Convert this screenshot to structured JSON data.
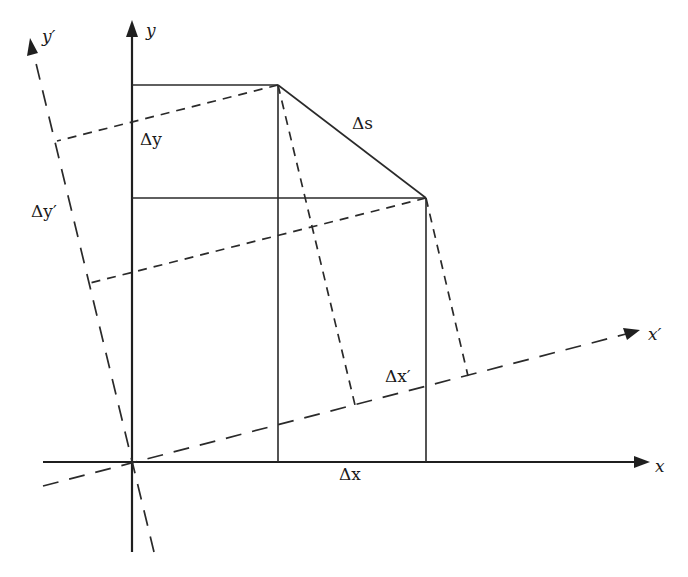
{
  "diagram": {
    "labels": {
      "x_axis": "x",
      "y_axis": "y",
      "x_prime_axis": "x′",
      "y_prime_axis": "y′",
      "delta_s": "Δs",
      "delta_x": "Δx",
      "delta_y": "Δy",
      "delta_x_prime": "Δx′",
      "delta_y_prime": "Δy′"
    },
    "colors": {
      "ink": "#2a2a2a",
      "background": "#ffffff"
    }
  }
}
